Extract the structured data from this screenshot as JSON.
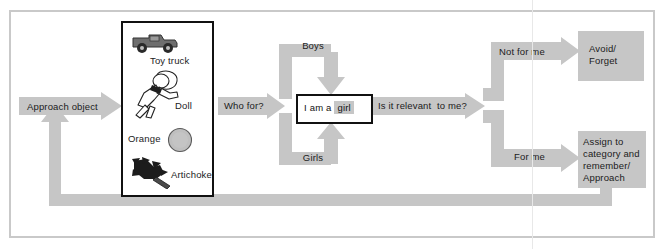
{
  "diagram": {
    "colors": {
      "block_gray": "#c6c6c6",
      "frame_gray": "#c9c9c9",
      "outline_black": "#111111",
      "text": "#1b1b1b",
      "page_white": "#ffffff"
    },
    "start_arrow": {
      "label": "Approach object"
    },
    "object_box": {
      "items": [
        {
          "icon": "toy-truck-icon",
          "label": "Toy truck"
        },
        {
          "icon": "doll-icon",
          "label": "Doll"
        },
        {
          "icon": "orange-icon",
          "label": "Orange"
        },
        {
          "icon": "artichoke-icon",
          "label": "Artichoke"
        }
      ]
    },
    "who_for_arrow": {
      "label": "Who for?"
    },
    "branches_gender": [
      {
        "label": "Boys"
      },
      {
        "label": "Girls"
      }
    ],
    "self_schema": {
      "prefix": "I am a ",
      "highlight": "girl"
    },
    "relevance_arrow": {
      "label": "Is it relevant  to me?"
    },
    "branches_relevance": [
      {
        "label": "Not for me"
      },
      {
        "label": "For me"
      }
    ],
    "outcomes": [
      {
        "label": "Avoid/\nForget"
      },
      {
        "label": "Assign to\ncategory and\nremember/\nApproach"
      }
    ],
    "feedback_loop": {
      "label": ""
    }
  }
}
